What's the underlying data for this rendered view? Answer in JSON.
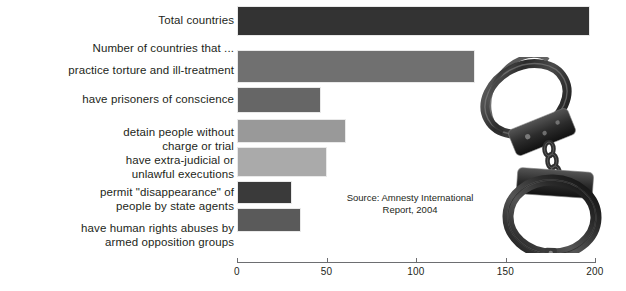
{
  "chart_data": {
    "type": "bar",
    "orientation": "horizontal",
    "title": "",
    "xlabel": "",
    "ylabel": "",
    "xlim": [
      0,
      200
    ],
    "xticks": [
      0,
      50,
      100,
      150,
      200
    ],
    "xtick_labels": [
      "0",
      "50",
      "100",
      "150",
      "200"
    ],
    "grid": false,
    "legend": null,
    "lead_in_label": "Number of countries that ...",
    "categories": [
      "Total countries",
      "practice torture and ill-treatment",
      "have prisoners of conscience",
      "detain people without\ncharge or trial",
      "have extra-judicial or\nunlawful executions",
      "permit \"disappearance\" of\npeople by state agents",
      "have human rights abuses by\narmed opposition groups"
    ],
    "values": [
      197,
      133,
      47,
      61,
      50,
      31,
      36
    ],
    "bar_colors": [
      "#333333",
      "#707070",
      "#666666",
      "#999999",
      "#aaaaaa",
      "#3a3a3a",
      "#5a5a5a"
    ],
    "annotations": [
      "Source: Amnesty International\nReport, 2004"
    ]
  },
  "labels": {
    "lead": "Number of countries that ...",
    "items": [
      "Total countries",
      "practice torture and ill-treatment",
      "have prisoners of conscience",
      "detain people without\ncharge or trial",
      "have extra-judicial or\nunlawful executions",
      "permit \"disappearance\" of\npeople by state agents",
      "have human rights abuses by\narmed opposition groups"
    ]
  },
  "axis": {
    "ticks": [
      "0",
      "50",
      "100",
      "150",
      "200"
    ]
  },
  "source": {
    "text": "Source: Amnesty International\nReport, 2004"
  },
  "image": {
    "handcuffs_alt": "handcuffs-photo"
  },
  "colors": {
    "text": "#231f20",
    "axis": "#6d6e71",
    "background": "#ffffff"
  }
}
